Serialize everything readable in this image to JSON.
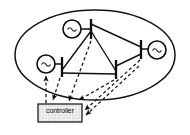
{
  "figure": {
    "kind": "power-system-control-block-diagram",
    "background": "#ffffff",
    "stroke_color": "#111111",
    "dashed_color": "#2b2b2b",
    "fill_hatch_color": "#8a8a8a",
    "controller_fill": "#f0f0f0"
  },
  "network": {
    "boundary_name": "power-network-ellipse",
    "ellipse": {
      "cx": 95,
      "cy": 55,
      "rx": 80,
      "ry": 45
    }
  },
  "generators": [
    {
      "id": "gen-top",
      "label": "~",
      "cx": 72,
      "cy": 29,
      "r": 9
    },
    {
      "id": "gen-left",
      "label": "~",
      "cx": 46,
      "cy": 64,
      "r": 9
    },
    {
      "id": "gen-right",
      "label": "~",
      "cx": 157,
      "cy": 50,
      "r": 9
    }
  ],
  "buses": [
    {
      "id": "bus-top",
      "x": 91,
      "y1": 19,
      "y2": 39
    },
    {
      "id": "bus-left",
      "x": 62,
      "y1": 58,
      "y2": 76
    },
    {
      "id": "bus-center",
      "x": 116,
      "y1": 60,
      "y2": 78
    },
    {
      "id": "bus-right",
      "x": 141,
      "y1": 40,
      "y2": 58
    }
  ],
  "lines": [
    {
      "id": "line-gentop-bustop",
      "from": [
        81,
        29
      ],
      "to": [
        91,
        29
      ]
    },
    {
      "id": "line-genleft-busleft",
      "from": [
        55,
        64
      ],
      "to": [
        62,
        64
      ]
    },
    {
      "id": "line-genright-busright",
      "from": [
        141,
        49
      ],
      "to": [
        148,
        49
      ]
    },
    {
      "id": "line-bustop-busleft",
      "from": [
        91,
        31
      ],
      "to": [
        62,
        69
      ]
    },
    {
      "id": "line-bustop-busright",
      "from": [
        91,
        25
      ],
      "to": [
        141,
        48
      ]
    },
    {
      "id": "line-bustop-buscenter",
      "from": [
        91,
        31
      ],
      "to": [
        116,
        70
      ]
    },
    {
      "id": "line-busleft-buscenter",
      "from": [
        62,
        73
      ],
      "to": [
        116,
        73
      ]
    },
    {
      "id": "line-buscenter-busright",
      "from": [
        116,
        66
      ],
      "to": [
        141,
        53
      ]
    }
  ],
  "controller": {
    "name": "controller-block",
    "label": "controller",
    "x": 38,
    "y": 104,
    "width": 44,
    "height": 18
  },
  "signals": [
    {
      "id": "measure-bustop-to-controller",
      "from": [
        91,
        40
      ],
      "to": [
        68,
        102
      ],
      "direction": "to-controller"
    },
    {
      "id": "measure-buscenter-to-controller",
      "from": [
        116,
        79
      ],
      "to": [
        78,
        101
      ],
      "direction": "to-controller"
    },
    {
      "id": "measure-busleft-to-controller",
      "from": [
        60,
        77
      ],
      "to": [
        52,
        101
      ],
      "direction": "to-controller"
    },
    {
      "id": "command-controller-to-genleft",
      "from": [
        46,
        101
      ],
      "to": [
        46,
        77
      ],
      "direction": "to-network"
    },
    {
      "id": "command-controller-to-busright",
      "from": [
        84,
        113
      ],
      "to": [
        142,
        60
      ],
      "direction": "to-network"
    },
    {
      "id": "command-controller-to-buscenter",
      "from": [
        84,
        117
      ],
      "to": [
        140,
        64
      ],
      "direction": "to-network"
    }
  ]
}
